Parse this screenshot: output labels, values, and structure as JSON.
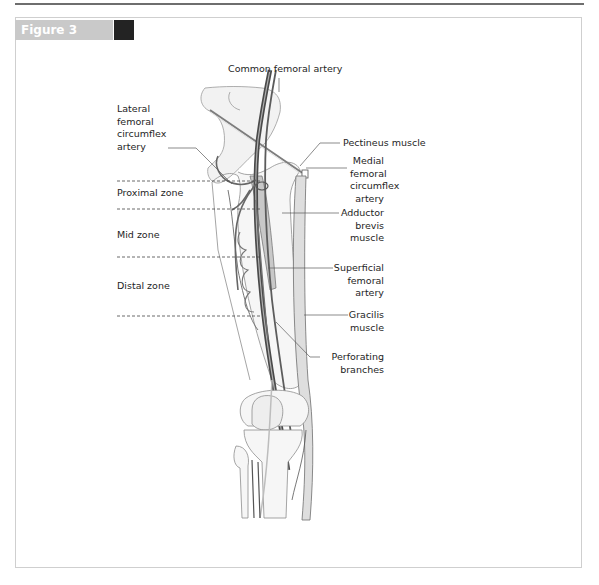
{
  "figure": {
    "label": "Figure 3",
    "bar_color": "#c9c9c9",
    "square_color": "#232323"
  },
  "labels": {
    "common_femoral": "Common femoral artery",
    "lateral_circumflex": "Lateral\nfemoral\ncircumflex\nartery",
    "pectineus": "Pectineus muscle",
    "medial_circumflex": "Medial\nfemoral\ncircumflex\nartery",
    "adductor_brevis": "Adductor\nbrevis\nmuscle",
    "superficial_femoral": "Superficial\nfemoral\nartery",
    "gracilis": "Gracilis\nmuscle",
    "perforating": "Perforating\nbranches"
  },
  "zones": {
    "proximal": "Proximal zone",
    "mid": "Mid zone",
    "distal": "Distal zone"
  }
}
